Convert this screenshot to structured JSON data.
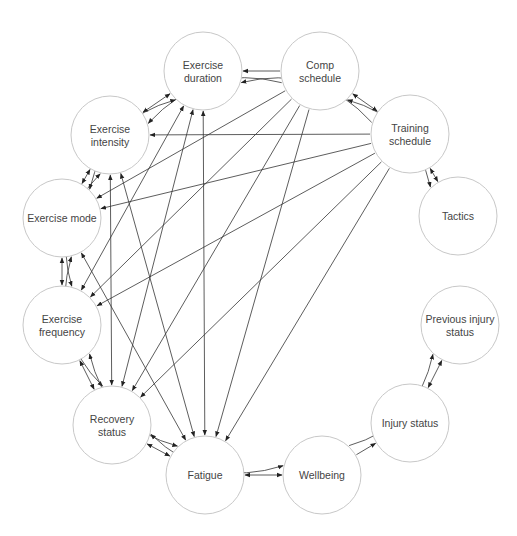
{
  "diagram": {
    "type": "directed-network",
    "colors": {
      "node_stroke": "#c8c8c8",
      "edge": "#333333",
      "text": "#444444",
      "background": "#ffffff"
    },
    "nodes": [
      {
        "id": "duration",
        "lines": [
          "Exercise",
          "duration"
        ],
        "cx": 203,
        "cy": 71
      },
      {
        "id": "comp",
        "lines": [
          "Comp",
          "schedule"
        ],
        "cx": 320,
        "cy": 71
      },
      {
        "id": "intensity",
        "lines": [
          "Exercise",
          "intensity"
        ],
        "cx": 110,
        "cy": 135
      },
      {
        "id": "training",
        "lines": [
          "Training",
          "schedule"
        ],
        "cx": 410,
        "cy": 134
      },
      {
        "id": "tactics",
        "lines": [
          "Tactics"
        ],
        "cx": 458,
        "cy": 216
      },
      {
        "id": "mode",
        "lines": [
          "Exercise mode"
        ],
        "cx": 62,
        "cy": 218
      },
      {
        "id": "frequency",
        "lines": [
          "Exercise",
          "frequency"
        ],
        "cx": 62,
        "cy": 325
      },
      {
        "id": "previnjury",
        "lines": [
          "Previous injury",
          "status"
        ],
        "cx": 460,
        "cy": 325
      },
      {
        "id": "recovery",
        "lines": [
          "Recovery",
          "status"
        ],
        "cx": 112,
        "cy": 425
      },
      {
        "id": "injury",
        "lines": [
          "Injury status"
        ],
        "cx": 410,
        "cy": 423
      },
      {
        "id": "fatigue",
        "lines": [
          "Fatigue"
        ],
        "cx": 205,
        "cy": 475
      },
      {
        "id": "wellbeing",
        "lines": [
          "Wellbeing"
        ],
        "cx": 322,
        "cy": 475
      }
    ],
    "edges": [
      {
        "from": "comp",
        "to": "duration",
        "bidirectional": false
      },
      {
        "from": "comp",
        "to": "training",
        "bidirectional": true
      },
      {
        "from": "comp",
        "to": "tactics",
        "bidirectional": true,
        "curved": true
      },
      {
        "from": "comp",
        "to": "intensity",
        "bidirectional": false,
        "curved": true
      },
      {
        "from": "comp",
        "to": "mode",
        "bidirectional": false
      },
      {
        "from": "comp",
        "to": "frequency",
        "bidirectional": false
      },
      {
        "from": "comp",
        "to": "recovery",
        "bidirectional": false
      },
      {
        "from": "comp",
        "to": "fatigue",
        "bidirectional": false
      },
      {
        "from": "training",
        "to": "duration",
        "bidirectional": false,
        "curved": true
      },
      {
        "from": "training",
        "to": "intensity",
        "bidirectional": false
      },
      {
        "from": "training",
        "to": "mode",
        "bidirectional": false
      },
      {
        "from": "training",
        "to": "frequency",
        "bidirectional": false
      },
      {
        "from": "training",
        "to": "recovery",
        "bidirectional": false
      },
      {
        "from": "training",
        "to": "fatigue",
        "bidirectional": false
      },
      {
        "from": "training",
        "to": "tactics",
        "bidirectional": true
      },
      {
        "from": "duration",
        "to": "intensity",
        "bidirectional": true
      },
      {
        "from": "duration",
        "to": "mode",
        "bidirectional": true,
        "curved": true
      },
      {
        "from": "duration",
        "to": "frequency",
        "bidirectional": true
      },
      {
        "from": "duration",
        "to": "recovery",
        "bidirectional": true
      },
      {
        "from": "duration",
        "to": "fatigue",
        "bidirectional": true
      },
      {
        "from": "intensity",
        "to": "mode",
        "bidirectional": true
      },
      {
        "from": "intensity",
        "to": "frequency",
        "bidirectional": true,
        "curved": true
      },
      {
        "from": "intensity",
        "to": "recovery",
        "bidirectional": true
      },
      {
        "from": "intensity",
        "to": "fatigue",
        "bidirectional": true
      },
      {
        "from": "mode",
        "to": "frequency",
        "bidirectional": true
      },
      {
        "from": "mode",
        "to": "recovery",
        "bidirectional": true,
        "curved": true
      },
      {
        "from": "mode",
        "to": "fatigue",
        "bidirectional": true
      },
      {
        "from": "frequency",
        "to": "recovery",
        "bidirectional": true
      },
      {
        "from": "frequency",
        "to": "fatigue",
        "bidirectional": true,
        "curved": true
      },
      {
        "from": "recovery",
        "to": "fatigue",
        "bidirectional": true
      },
      {
        "from": "recovery",
        "to": "wellbeing",
        "bidirectional": true,
        "curved": true
      },
      {
        "from": "fatigue",
        "to": "wellbeing",
        "bidirectional": true
      },
      {
        "from": "wellbeing",
        "to": "injury",
        "bidirectional": false
      },
      {
        "from": "wellbeing",
        "to": "previnjury",
        "bidirectional": false,
        "curved": true
      },
      {
        "from": "injury",
        "to": "previnjury",
        "bidirectional": true
      }
    ]
  }
}
